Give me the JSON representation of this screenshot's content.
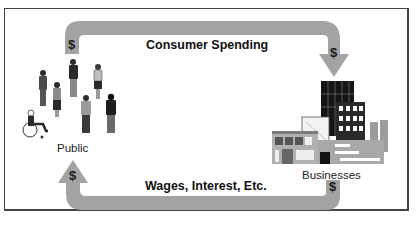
{
  "diagram": {
    "type": "circular-flow",
    "nodes": [
      {
        "id": "public",
        "label": "Public"
      },
      {
        "id": "businesses",
        "label": "Businesses"
      }
    ],
    "flows": [
      {
        "from": "public",
        "to": "businesses",
        "label": "Consumer Spending",
        "symbol": "$"
      },
      {
        "from": "businesses",
        "to": "public",
        "label": "Wages, Interest, Etc.",
        "symbol": "$"
      }
    ],
    "colors": {
      "arrow": "#a3a3a3",
      "frame": "#444444",
      "text": "#111111"
    }
  }
}
